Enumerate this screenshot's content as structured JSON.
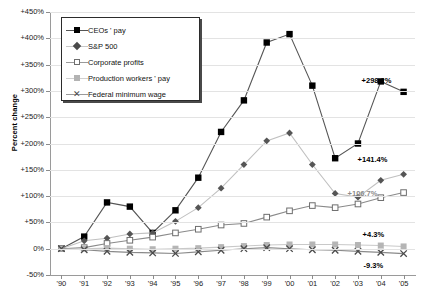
{
  "chart_data": {
    "type": "line",
    "title": "",
    "xlabel": "",
    "ylabel": "Percent change",
    "ylim": [
      -50,
      450
    ],
    "ytick_values": [
      450,
      400,
      350,
      300,
      250,
      200,
      150,
      100,
      50,
      0,
      -50
    ],
    "ytick_labels": [
      "+450%",
      "+400%",
      "+350%",
      "+300%",
      "+250%",
      "+200%",
      "+150%",
      "+100%",
      "+50%",
      "0%",
      "-50%"
    ],
    "grid": true,
    "legend_position": "upper-left-inset",
    "x": [
      1990,
      1991,
      1992,
      1993,
      1994,
      1995,
      1996,
      1997,
      1998,
      1999,
      2000,
      2001,
      2002,
      2003,
      2004,
      2005
    ],
    "xtick_labels": [
      "'90",
      "'91",
      "'92",
      "'93",
      "'94",
      "'95",
      "'96",
      "'97",
      "'98",
      "'99",
      "'00",
      "'01",
      "'02",
      "'03",
      "'04",
      "'05"
    ],
    "series": [
      {
        "name": "CEOs' pay",
        "marker": "filled-square",
        "color": "#000000",
        "values": [
          0,
          23,
          88,
          80,
          30,
          73,
          135,
          222,
          282,
          392,
          408,
          310,
          172,
          200,
          318,
          298.2
        ],
        "end_label": "+298.2%"
      },
      {
        "name": "S&P 500",
        "marker": "filled-diamond",
        "color": "#555555",
        "values": [
          0,
          15,
          20,
          28,
          30,
          52,
          78,
          115,
          160,
          205,
          220,
          160,
          105,
          98,
          130,
          141.4
        ],
        "end_label": "+141.4%"
      },
      {
        "name": "Corporate profits",
        "marker": "open-square",
        "color": "#6e6e6e",
        "values": [
          0,
          2,
          10,
          16,
          22,
          30,
          37,
          45,
          48,
          60,
          72,
          82,
          78,
          85,
          97,
          106.7
        ],
        "end_label": "+106.7%"
      },
      {
        "name": "Production workers ' pay",
        "marker": "gray-square",
        "color": "#b3b3b3",
        "values": [
          0,
          0,
          1,
          0,
          -1,
          0,
          1,
          3,
          5,
          7,
          8,
          8,
          8,
          7,
          6,
          4.3
        ],
        "end_label": "+4.3%"
      },
      {
        "name": "Federal minimum wage",
        "marker": "x",
        "color": "#4a4a4a",
        "values": [
          0,
          -2,
          -5,
          -7,
          -8,
          -9,
          -6,
          -3,
          0,
          2,
          0,
          -2,
          -3,
          -5,
          -7,
          -9.3
        ],
        "end_label": "-9.3%"
      }
    ]
  },
  "legend": {
    "items": [
      {
        "label": "CEOs ' pay"
      },
      {
        "label": "S&P 500"
      },
      {
        "label": "Corporate profits"
      },
      {
        "label": "Production workers  ' pay"
      },
      {
        "label": "Federal minimum wage"
      }
    ]
  }
}
